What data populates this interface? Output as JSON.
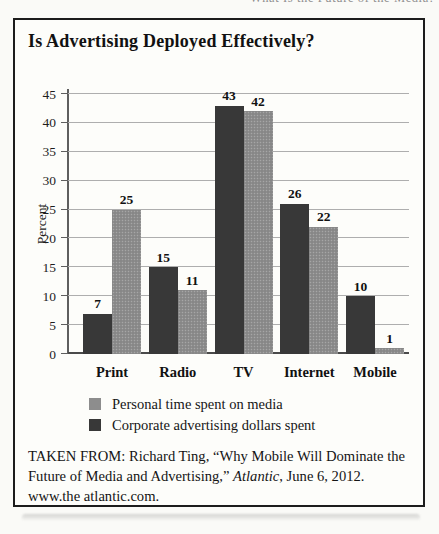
{
  "page": {
    "clipped_running_header": "What Is the Future of the Media?"
  },
  "figure": {
    "title": "Is Advertising Deployed Effectively?",
    "source": {
      "prefix": "TAKEN FROM: Richard Ting, “Why Mobile Will Dominate the Future of Media and Advertising,” ",
      "italic": "Atlantic",
      "suffix": ", June 6, 2012. www.the atlantic.com."
    }
  },
  "chart_data": {
    "type": "bar",
    "title": "Is Advertising Deployed Effectively?",
    "categories": [
      "Print",
      "Radio",
      "TV",
      "Internet",
      "Mobile"
    ],
    "series": [
      {
        "name": "Corporate advertising dollars spent",
        "color": "#383838",
        "values": [
          7,
          15,
          43,
          26,
          10
        ]
      },
      {
        "name": "Personal time spent on media",
        "color": "#8d8d8d",
        "values": [
          25,
          11,
          42,
          22,
          1
        ]
      }
    ],
    "xlabel": "",
    "ylabel": "Percent",
    "ylim": [
      0,
      45
    ],
    "ytick_step": 5,
    "grid": true,
    "value_labels": true,
    "legend_position": "bottom-left",
    "legend": [
      {
        "label": "Personal time spent on media",
        "color": "#8d8d8d"
      },
      {
        "label": "Corporate advertising dollars spent",
        "color": "#383838"
      }
    ],
    "colors": {
      "grid": "#aeaeae",
      "axis": "#5f5f5f",
      "border": "#1c1c1c"
    }
  }
}
